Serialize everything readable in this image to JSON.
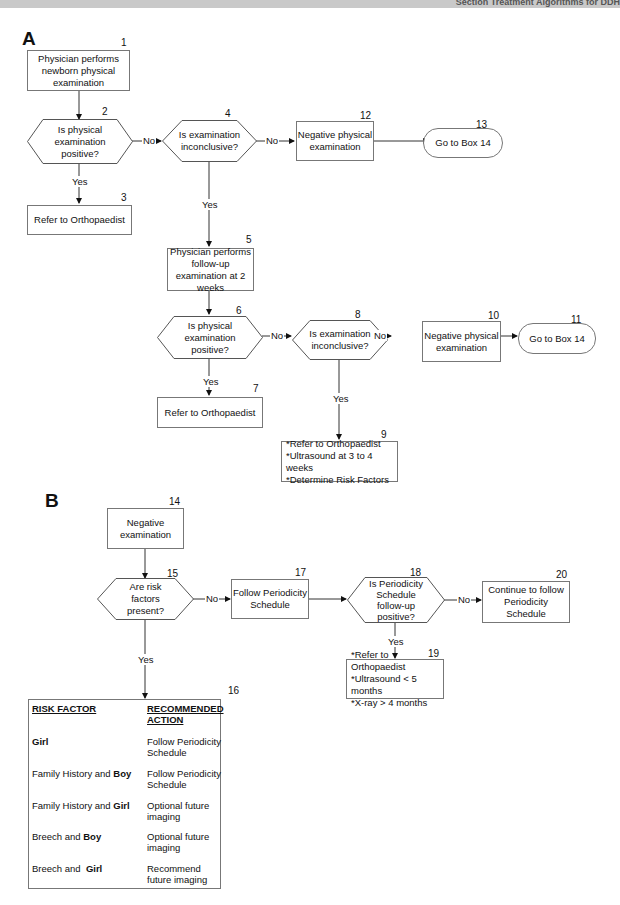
{
  "header": {
    "text": "Section Treatment Algorithms for DDH"
  },
  "panel_a": {
    "letter": "A",
    "nodes": {
      "n1": {
        "num": "1",
        "text": "Physician performs newborn physical examination"
      },
      "n2": {
        "num": "2",
        "text": "Is physical examination positive?"
      },
      "n3": {
        "num": "3",
        "text": "Refer to Orthopaedist"
      },
      "n4": {
        "num": "4",
        "text": "Is examination inconclusive?"
      },
      "n5": {
        "num": "5",
        "text": "Physician performs follow-up examination at 2 weeks"
      },
      "n6": {
        "num": "6",
        "text": "Is physical examination positive?"
      },
      "n7": {
        "num": "7",
        "text": "Refer to Orthopaedist"
      },
      "n8": {
        "num": "8",
        "text": "Is examination inconclusive?"
      },
      "n9": {
        "num": "9",
        "lines": [
          "*Refer to Orthopaedist",
          "*Ultrasound at 3 to 4 weeks",
          "*Determine Risk Factors"
        ]
      },
      "n10": {
        "num": "10",
        "text": "Negative physical examination"
      },
      "n11": {
        "num": "11",
        "text": "Go to Box 14"
      },
      "n12": {
        "num": "12",
        "text": "Negative physical examination"
      },
      "n13": {
        "num": "13",
        "text": "Go to Box 14"
      }
    },
    "edge_labels": {
      "yes": "Yes",
      "no": "No"
    }
  },
  "panel_b": {
    "letter": "B",
    "nodes": {
      "n14": {
        "num": "14",
        "text": "Negative examination"
      },
      "n15": {
        "num": "15",
        "text": "Are risk factors present?"
      },
      "n17": {
        "num": "17",
        "text": "Follow Periodicity Schedule"
      },
      "n18": {
        "num": "18",
        "text": "Is Periodicity Schedule follow-up positive?"
      },
      "n19": {
        "num": "19",
        "lines": [
          "*Refer to Orthopaedist",
          "*Ultrasound < 5 months",
          "*X-ray > 4 months"
        ]
      },
      "n20": {
        "num": "20",
        "text": "Continue to follow Periodicity Schedule"
      }
    },
    "table16": {
      "num": "16",
      "headers": [
        "RISK FACTOR",
        "RECOMMENDED ACTION"
      ],
      "rows": [
        {
          "factor_pre": "",
          "factor_bold": "Girl",
          "action": "Follow Periodicity Schedule"
        },
        {
          "factor_pre": "Family History and ",
          "factor_bold": "Boy",
          "action": "Follow Periodicity Schedule"
        },
        {
          "factor_pre": "Family History and ",
          "factor_bold": "Girl",
          "action": "Optional future imaging"
        },
        {
          "factor_pre": "Breech and ",
          "factor_bold": "Boy",
          "action": "Optional future imaging"
        },
        {
          "factor_pre": "Breech and  ",
          "factor_bold": "Girl",
          "action": "Recommend future imaging"
        }
      ]
    },
    "edge_labels": {
      "yes": "Yes",
      "no": "No"
    }
  }
}
